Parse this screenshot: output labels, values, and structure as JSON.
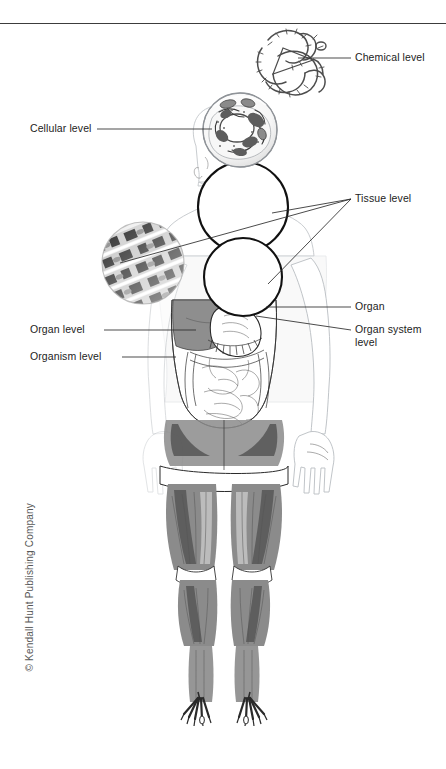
{
  "figure": {
    "top_rule": true,
    "labels": [
      {
        "id": "chemical-level",
        "text": "Chemical level",
        "x": 355,
        "y": 52,
        "leader_from": [
          296,
          58
        ],
        "leader_to": [
          349,
          58
        ],
        "description": "A twisted protein / molecular chain"
      },
      {
        "id": "cellular-level",
        "text": "Cellular level",
        "x": 30,
        "y": 122,
        "leader_from": [
          97,
          129
        ],
        "leader_to": [
          213,
          129
        ],
        "description": "A cell with nucleus and organelles"
      },
      {
        "id": "tissue-level",
        "text": "Tissue level",
        "x": 355,
        "y": 193,
        "leader_from": [
          349,
          199
        ],
        "leader_to": [
          120,
          262
        ],
        "description": "Connective, epithelial and muscle tissue circles"
      },
      {
        "id": "organ",
        "text": "Organ",
        "x": 355,
        "y": 301,
        "leader_from": [
          349,
          307
        ],
        "leader_to": [
          268,
          307
        ],
        "description": "Stomach"
      },
      {
        "id": "organ-system-level",
        "text": "Organ system\nlevel",
        "x": 355,
        "y": 324,
        "leader_from": [
          349,
          330
        ],
        "leader_to": [
          256,
          317
        ],
        "description": "Digestive system"
      },
      {
        "id": "organ-level",
        "text": "Organ level",
        "x": 30,
        "y": 323,
        "leader_from": [
          104,
          330
        ],
        "leader_to": [
          196,
          330
        ],
        "description": "Stomach within abdomen"
      },
      {
        "id": "organism-level",
        "text": "Organism level",
        "x": 30,
        "y": 350,
        "leader_from": [
          122,
          357
        ],
        "leader_to": [
          174,
          357
        ],
        "description": "Whole human body"
      }
    ],
    "copyright": "© Kendall Hunt Publishing Company",
    "insets": [
      {
        "id": "chemical-inset",
        "name": "molecular-chain",
        "cx": 292,
        "cy": 60,
        "r": 32
      },
      {
        "id": "cellular-inset",
        "name": "cell-diagram",
        "cx": 240,
        "cy": 130,
        "r": 38
      },
      {
        "id": "connective-tissue-inset",
        "name": "connective-tissue",
        "cx": 243,
        "cy": 207,
        "r": 46
      },
      {
        "id": "epithelial-tissue-inset",
        "name": "epithelial-tissue",
        "cx": 243,
        "cy": 277,
        "r": 40
      },
      {
        "id": "muscle-tissue-inset",
        "name": "muscle-tissue",
        "cx": 143,
        "cy": 263,
        "r": 42
      }
    ],
    "body": {
      "name": "human-figure",
      "parts": [
        "head",
        "torso-ghost",
        "digestive-organs",
        "arms",
        "legs-musculature",
        "feet-bones"
      ]
    }
  }
}
